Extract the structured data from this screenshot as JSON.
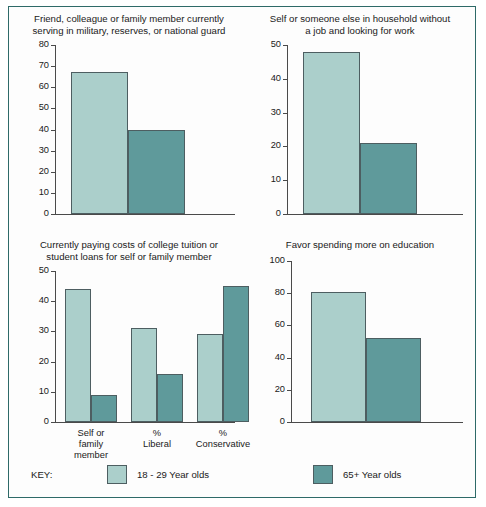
{
  "figure": {
    "border_color": "#2e6a68",
    "background": "#fdfdfd"
  },
  "key": {
    "label": "KEY:",
    "entries": [
      {
        "label": "18 - 29 Year olds",
        "color": "#abcfcb"
      },
      {
        "label": "65+ Year olds",
        "color": "#5f9a9b"
      }
    ]
  },
  "chart_data": [
    {
      "type": "bar",
      "panel": "top-left",
      "title": "Friend, colleague or family member currently\nserving in military, reserves, or national guard",
      "xlabel": "",
      "ylabel": "",
      "ylim": [
        0,
        80
      ],
      "yticks": [
        0,
        10,
        20,
        30,
        40,
        50,
        60,
        70,
        80
      ],
      "ytick_labels": [
        "0",
        "10",
        "20",
        "30",
        "40",
        "50",
        "60",
        "70",
        "80"
      ],
      "grid": false,
      "legend_position": "figure-bottom",
      "categories": [
        ""
      ],
      "series": [
        {
          "name": "18 - 29 Year olds",
          "color": "#abcfcb",
          "values": [
            67
          ]
        },
        {
          "name": "65+ Year olds",
          "color": "#5f9a9b",
          "values": [
            40
          ]
        }
      ]
    },
    {
      "type": "bar",
      "panel": "top-right",
      "title": "Self or someone else in household without\na job and looking for work",
      "xlabel": "",
      "ylabel": "",
      "ylim": [
        0,
        50
      ],
      "yticks": [
        0,
        10,
        20,
        30,
        40,
        50
      ],
      "ytick_labels": [
        "0",
        "10",
        "20",
        "30",
        "40",
        "50"
      ],
      "grid": false,
      "legend_position": "figure-bottom",
      "categories": [
        ""
      ],
      "series": [
        {
          "name": "18 - 29 Year olds",
          "color": "#abcfcb",
          "values": [
            48
          ]
        },
        {
          "name": "65+ Year olds",
          "color": "#5f9a9b",
          "values": [
            21
          ]
        }
      ]
    },
    {
      "type": "bar",
      "panel": "bottom-left",
      "title": "Currently paying costs of college tuition or\nstudent loans for self or family member",
      "xlabel": "",
      "ylabel": "",
      "ylim": [
        0,
        50
      ],
      "yticks": [
        0,
        10,
        20,
        30,
        40,
        50
      ],
      "ytick_labels": [
        "0",
        "10",
        "20",
        "30",
        "40",
        "50"
      ],
      "grid": false,
      "legend_position": "figure-bottom",
      "categories": [
        "Self or\nfamily\nmember",
        "%\nLiberal",
        "%\nConservative"
      ],
      "series": [
        {
          "name": "18 - 29 Year olds",
          "color": "#abcfcb",
          "values": [
            44,
            31,
            29
          ]
        },
        {
          "name": "65+ Year olds",
          "color": "#5f9a9b",
          "values": [
            9,
            16,
            45
          ]
        }
      ]
    },
    {
      "type": "bar",
      "panel": "bottom-right",
      "title": "Favor spending more on education",
      "xlabel": "",
      "ylabel": "",
      "ylim": [
        0,
        100
      ],
      "yticks": [
        0,
        20,
        40,
        60,
        80,
        100
      ],
      "ytick_labels": [
        "0",
        "20",
        "40",
        "60",
        "80",
        "100"
      ],
      "grid": false,
      "legend_position": "figure-bottom",
      "categories": [
        ""
      ],
      "series": [
        {
          "name": "18 - 29 Year olds",
          "color": "#abcfcb",
          "values": [
            81
          ]
        },
        {
          "name": "65+ Year olds",
          "color": "#5f9a9b",
          "values": [
            52
          ]
        }
      ]
    }
  ]
}
